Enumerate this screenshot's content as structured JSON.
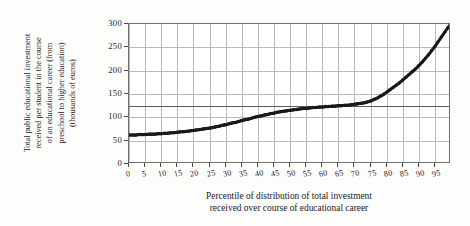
{
  "chart_data": {
    "type": "scatter",
    "title": "",
    "xlabel": "Percentile of distribution of total investment received over course of educational career",
    "xlabel_line1": "Percentile of distribution of total investment",
    "xlabel_line2": "received over course of educational career",
    "ylabel": "Total public educational investment received per student in the course of an educational career (from preschool to higher education) (thousands of euros)",
    "ylabel_lines": [
      "Total public educational investment",
      "received per student in the course",
      "of an educational career (from",
      "preschool to higher education)",
      "(thousands of euros)"
    ],
    "xlim": [
      0,
      100
    ],
    "ylim": [
      0,
      300
    ],
    "xticks": [
      0,
      5,
      10,
      15,
      20,
      25,
      30,
      35,
      40,
      45,
      50,
      55,
      60,
      65,
      70,
      75,
      80,
      85,
      90,
      95
    ],
    "xtick_labels": [
      "0",
      "5",
      "10",
      "15",
      "20",
      "25",
      "30",
      "35",
      "40",
      "45",
      "50",
      "55",
      "60",
      "65",
      "70",
      "75",
      "80",
      "85",
      "90",
      "95"
    ],
    "yticks": [
      0,
      50,
      100,
      150,
      200,
      250,
      300
    ],
    "ytick_labels": [
      "0",
      "50",
      "100",
      "150",
      "200",
      "250",
      "300"
    ],
    "grid": true,
    "emphasis_gridline_y": 125,
    "marker_color": "#1a1a1a",
    "grid_color": "#b9b9bd",
    "axis_color": "#6f6f6f",
    "legend": null,
    "x": [
      0,
      1,
      2,
      3,
      4,
      5,
      6,
      7,
      8,
      9,
      10,
      11,
      12,
      13,
      14,
      15,
      16,
      17,
      18,
      19,
      20,
      21,
      22,
      23,
      24,
      25,
      26,
      27,
      28,
      29,
      30,
      31,
      32,
      33,
      34,
      35,
      36,
      37,
      38,
      39,
      40,
      41,
      42,
      43,
      44,
      45,
      46,
      47,
      48,
      49,
      50,
      51,
      52,
      53,
      54,
      55,
      56,
      57,
      58,
      59,
      60,
      61,
      62,
      63,
      64,
      65,
      66,
      67,
      68,
      69,
      70,
      71,
      72,
      73,
      74,
      75,
      76,
      77,
      78,
      79,
      80,
      81,
      82,
      83,
      84,
      85,
      86,
      87,
      88,
      89,
      90,
      91,
      92,
      93,
      94,
      95,
      96,
      97,
      98,
      99,
      100
    ],
    "y": [
      62,
      62,
      62,
      63,
      63,
      63,
      64,
      64,
      64,
      65,
      65,
      66,
      66,
      67,
      67,
      68,
      69,
      69,
      70,
      71,
      72,
      73,
      74,
      75,
      76,
      77,
      78,
      80,
      81,
      83,
      84,
      86,
      88,
      89,
      91,
      93,
      95,
      96,
      98,
      100,
      102,
      103,
      105,
      106,
      108,
      109,
      111,
      112,
      113,
      114,
      115,
      116,
      117,
      118,
      119,
      119,
      120,
      121,
      121,
      122,
      122,
      123,
      123,
      124,
      124,
      125,
      125,
      126,
      126,
      127,
      128,
      129,
      130,
      131,
      133,
      135,
      138,
      141,
      145,
      149,
      154,
      159,
      164,
      169,
      174,
      180,
      186,
      192,
      198,
      204,
      211,
      218,
      226,
      234,
      243,
      252,
      262,
      272,
      282,
      292,
      300
    ]
  }
}
